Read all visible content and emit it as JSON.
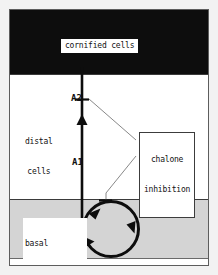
{
  "figure": {
    "background_color": "#f2f2f2",
    "frame_color": "#5d5d5d"
  },
  "zones": [
    {
      "key": "cornified",
      "label": "cornified cells",
      "fill": "#0d0d0d",
      "label_text_color": "#111111",
      "label_bg": "#ffffff"
    },
    {
      "key": "distal",
      "label_line1": "distal",
      "label_line2": "cells",
      "fill": "#ffffff",
      "label_text_color": "#111111"
    },
    {
      "key": "basal",
      "label_line1": "basal",
      "label_line2": "mitotic cells",
      "fill": "#d4d4d4",
      "label_text_color": "#111111"
    }
  ],
  "tiers": [
    {
      "key": "a2",
      "label": "A2"
    },
    {
      "key": "a1",
      "label": "A1"
    }
  ],
  "callout": {
    "line1": "chalone",
    "line2": "inhibition",
    "border_color": "#3c3c3c",
    "bg": "#ffffff"
  },
  "diagram_elements": {
    "migration_axis": "vertical upward arrow from basal layer to cornified layer",
    "cell_cycle": "clockwise circular arrow in basal mitotic cells zone",
    "inhibition_marks": 2,
    "connector_count": 2,
    "stroke_color": "#0d0d0d",
    "connector_color": "#6e6e6e"
  }
}
